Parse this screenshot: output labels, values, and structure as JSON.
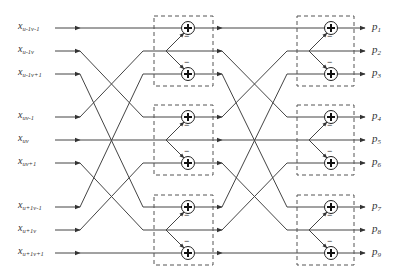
{
  "diagram": {
    "title": "",
    "colors": {
      "line": "#444444",
      "box": "#555555",
      "text": "#333333",
      "background": "#ffffff"
    },
    "inputs": [
      {
        "base": "x",
        "sub": "u-1v-1",
        "y": 28
      },
      {
        "base": "x",
        "sub": "u-1v",
        "y": 51
      },
      {
        "base": "x",
        "sub": "u-1v+1",
        "y": 74
      },
      {
        "base": "x",
        "sub": "uv-1",
        "y": 117
      },
      {
        "base": "x",
        "sub": "uv",
        "y": 140
      },
      {
        "base": "x",
        "sub": "uv+1",
        "y": 163
      },
      {
        "base": "x",
        "sub": "u+1v-1",
        "y": 207
      },
      {
        "base": "x",
        "sub": "u+1v",
        "y": 230
      },
      {
        "base": "x",
        "sub": "u+1v+1",
        "y": 253
      }
    ],
    "outputs": [
      {
        "base": "p",
        "sub": "1",
        "y": 28
      },
      {
        "base": "p",
        "sub": "2",
        "y": 51
      },
      {
        "base": "p",
        "sub": "3",
        "y": 74
      },
      {
        "base": "p",
        "sub": "4",
        "y": 117
      },
      {
        "base": "p",
        "sub": "5",
        "y": 140
      },
      {
        "base": "p",
        "sub": "6",
        "y": 163
      },
      {
        "base": "p",
        "sub": "7",
        "y": 207
      },
      {
        "base": "p",
        "sub": "8",
        "y": 230
      },
      {
        "base": "p",
        "sub": "9",
        "y": 253
      }
    ],
    "stage1_permutation": [
      0,
      3,
      6,
      1,
      4,
      7,
      2,
      5,
      8
    ],
    "stage2_permutation": [
      0,
      3,
      6,
      1,
      4,
      7,
      2,
      5,
      8
    ],
    "adder_symbol": "+",
    "minus_sign": "−",
    "stages": [
      {
        "name": "stage-1",
        "box_x": 154,
        "box_w": 59,
        "adder_x": 188
      },
      {
        "name": "stage-2",
        "box_x": 297,
        "box_w": 57,
        "adder_x": 331
      }
    ]
  }
}
